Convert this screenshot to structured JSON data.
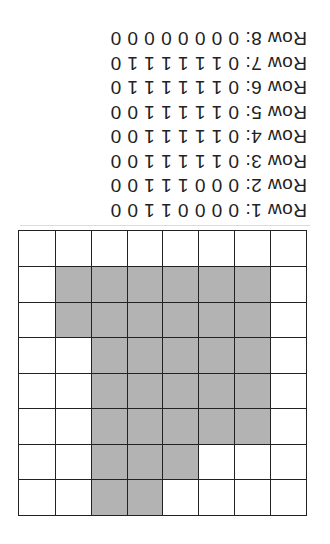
{
  "grid": {
    "rows": 8,
    "cols": 8,
    "fill_color": "#b3b3b3",
    "empty_color": "#ffffff",
    "line_color": "#222222",
    "cells": [
      [
        0,
        0,
        0,
        0,
        1,
        1,
        0,
        0
      ],
      [
        0,
        0,
        0,
        1,
        1,
        1,
        0,
        0
      ],
      [
        0,
        1,
        1,
        1,
        1,
        1,
        0,
        0
      ],
      [
        0,
        1,
        1,
        1,
        1,
        1,
        0,
        0
      ],
      [
        0,
        1,
        1,
        1,
        1,
        1,
        0,
        0
      ],
      [
        0,
        1,
        1,
        1,
        1,
        1,
        1,
        0
      ],
      [
        0,
        1,
        1,
        1,
        1,
        1,
        1,
        0
      ],
      [
        0,
        0,
        0,
        0,
        0,
        0,
        0,
        0
      ]
    ]
  },
  "rows": [
    {
      "label": "Row 1:",
      "values": "0 0 0 0 1 1 0 0"
    },
    {
      "label": "Row 2:",
      "values": "0 0 0 1 1 1 0 0"
    },
    {
      "label": "Row 3:",
      "values": "0 1 1 1 1 1 0 0"
    },
    {
      "label": "Row 4:",
      "values": "0 1 1 1 1 1 0 0"
    },
    {
      "label": "Row 5:",
      "values": "0 1 1 1 1 1 0 0"
    },
    {
      "label": "Row 6:",
      "values": "0 1 1 1 1 1 1 0"
    },
    {
      "label": "Row 7:",
      "values": "0 1 1 1 1 1 1 0"
    },
    {
      "label": "Row 8:",
      "values": "0 0 0 0 0 0 0 0"
    }
  ],
  "orientation": "rotated-180"
}
